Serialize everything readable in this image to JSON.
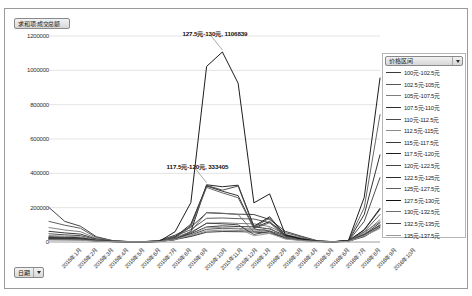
{
  "value_field_button": {
    "label": "求和项:成交总额",
    "caret_icon": "chevron-down-icon"
  },
  "date_field_button": {
    "label": "日期",
    "caret_icon": "chevron-down-icon"
  },
  "legend": {
    "header_label": "价格区间",
    "caret_icon": "chevron-down-icon",
    "position": "right",
    "items": [
      "100元-102.5元",
      "102.5元-105元",
      "105元-107.5元",
      "107.5元-110元",
      "110元-112.5元",
      "112.5元-115元",
      "115元-117.5元",
      "117.5元-120元",
      "120元-122.5元",
      "122.5元-125元",
      "125元-127.5元",
      "127.5元-130元",
      "130元-132.5元",
      "132.5元-135元",
      "135元-137.5元"
    ]
  },
  "annotations": [
    {
      "text": "127.5元-130元, 1106839",
      "series": "127.5元-130元",
      "x_index": 11,
      "value": 1106839
    },
    {
      "text": "117.5元-120元, 333405",
      "series": "117.5元-120元",
      "x_index": 10,
      "value": 333405
    }
  ],
  "chart_data": {
    "type": "line",
    "title": "求和项:成交总额",
    "xlabel": "日期",
    "ylabel": "求和项:成交总额",
    "ylim": [
      0,
      1200000
    ],
    "ytick_labels": [
      "0",
      "200000",
      "400000",
      "600000",
      "800000",
      "1000000",
      "1200000"
    ],
    "yticks": [
      0,
      200000,
      400000,
      600000,
      800000,
      1000000,
      1200000
    ],
    "grid": true,
    "grid_axis": "y",
    "legend_title": "价格区间",
    "legend_position": "right",
    "categories": [
      "2015年1月",
      "2015年2月",
      "2015年3月",
      "2015年4月",
      "2015年5月",
      "2015年6月",
      "2015年7月",
      "2015年8月",
      "2015年9月",
      "2015年10月",
      "2015年11月",
      "2015年12月",
      "2016年1月",
      "2016年2月",
      "2016年3月",
      "2016年4月",
      "2016年5月",
      "2016年6月",
      "2016年7月",
      "2016年8月",
      "2016年9月",
      "2016年10月"
    ],
    "series": [
      {
        "name": "100元-102.5元",
        "color": "#3a3a3a",
        "values": [
          201000,
          120000,
          92000,
          31000,
          9000,
          3000,
          2000,
          9000,
          40000,
          86000,
          170000,
          166000,
          162000,
          160000,
          131000,
          62000,
          34000,
          8000,
          2000,
          9000,
          70000,
          190000
        ]
      },
      {
        "name": "102.5元-105元",
        "color": "#555555",
        "values": [
          120000,
          98000,
          80000,
          26000,
          8000,
          2500,
          1800,
          8000,
          34000,
          72000,
          138000,
          140000,
          136000,
          134000,
          112000,
          54000,
          30000,
          7000,
          1800,
          8000,
          60000,
          160000
        ]
      },
      {
        "name": "105元-107.5元",
        "color": "#7d7d7d",
        "values": [
          84000,
          70000,
          60000,
          21000,
          6500,
          2000,
          1500,
          6500,
          27000,
          58000,
          108000,
          112000,
          108000,
          106000,
          90000,
          44000,
          25000,
          6000,
          1500,
          7000,
          50000,
          130000
        ]
      },
      {
        "name": "107.5元-110元",
        "color": "#2e2e2e",
        "values": [
          62000,
          53000,
          46000,
          17000,
          5500,
          1800,
          1300,
          5500,
          22000,
          48000,
          88000,
          94000,
          90000,
          88000,
          76000,
          38000,
          21000,
          5000,
          1300,
          6000,
          43000,
          112000
        ]
      },
      {
        "name": "110元-112.5元",
        "color": "#4a4a4a",
        "values": [
          48000,
          42000,
          37000,
          14000,
          4800,
          1500,
          1100,
          4800,
          19000,
          41000,
          74000,
          80000,
          77000,
          75000,
          65000,
          33000,
          18000,
          4500,
          1100,
          5500,
          38000,
          100000
        ]
      },
      {
        "name": "112.5元-115元",
        "color": "#8c8c8c",
        "values": [
          38000,
          34000,
          30000,
          12000,
          4200,
          1300,
          1000,
          4200,
          16500,
          36000,
          64000,
          69000,
          67000,
          65000,
          57000,
          29000,
          16000,
          4000,
          1000,
          5000,
          34000,
          92000
        ]
      },
      {
        "name": "115元-117.5元",
        "color": "#383838",
        "values": [
          31000,
          28000,
          25000,
          10000,
          3700,
          1200,
          900,
          3700,
          14500,
          32000,
          57000,
          61000,
          60000,
          58000,
          51000,
          26000,
          14500,
          3600,
          900,
          4600,
          31000,
          86000
        ]
      },
      {
        "name": "117.5元-120元",
        "color": "#1f1f1f",
        "values": [
          26000,
          24000,
          21000,
          8800,
          3300,
          1100,
          800,
          3300,
          13000,
          61000,
          333405,
          322000,
          331000,
          92000,
          147000,
          38000,
          17000,
          3800,
          850,
          5200,
          72000,
          196000
        ]
      },
      {
        "name": "120元-122.5元",
        "color": "#454545",
        "values": [
          24000,
          22000,
          19000,
          8000,
          3000,
          1000,
          750,
          3000,
          25000,
          96000,
          330000,
          302000,
          326000,
          86000,
          140000,
          36000,
          16000,
          3600,
          800,
          6000,
          120000,
          375000
        ]
      },
      {
        "name": "122.5元-125元",
        "color": "#2a2a2a",
        "values": [
          22000,
          20000,
          17500,
          7400,
          2800,
          950,
          700,
          2900,
          30000,
          104000,
          326000,
          296000,
          270000,
          82000,
          120000,
          33000,
          15000,
          3400,
          780,
          7000,
          160000,
          508000
        ]
      },
      {
        "name": "125元-127.5元",
        "color": "#606060",
        "values": [
          20000,
          18500,
          16000,
          6900,
          2600,
          900,
          650,
          2800,
          26000,
          88000,
          318000,
          286000,
          258000,
          78000,
          112000,
          31000,
          14000,
          3200,
          760,
          8000,
          200000,
          742000
        ]
      },
      {
        "name": "127.5元-130元",
        "color": "#111111",
        "values": [
          18000,
          17000,
          15000,
          6400,
          2400,
          850,
          620,
          4000,
          60000,
          230000,
          1023000,
          1106839,
          925000,
          228000,
          280000,
          42000,
          17000,
          3500,
          800,
          9000,
          260000,
          955000
        ]
      },
      {
        "name": "130元-132.5元",
        "color": "#6f6f6f",
        "values": [
          16000,
          15000,
          13500,
          5900,
          2200,
          800,
          580,
          2600,
          20000,
          62000,
          172000,
          168000,
          160000,
          58000,
          82000,
          24000,
          11000,
          2800,
          700,
          5000,
          58000,
          118000
        ]
      },
      {
        "name": "132.5元-135元",
        "color": "#3f3f3f",
        "values": [
          14000,
          13000,
          12000,
          5400,
          2000,
          750,
          540,
          2400,
          17000,
          52000,
          110000,
          106000,
          100000,
          44000,
          62000,
          20000,
          9500,
          2500,
          650,
          4200,
          45000,
          96000
        ]
      },
      {
        "name": "135元-137.5元",
        "color": "#9a9a9a",
        "values": [
          12000,
          11500,
          10500,
          4900,
          1850,
          700,
          500,
          2200,
          14000,
          42000,
          86000,
          84000,
          80000,
          36000,
          50000,
          17000,
          8200,
          2200,
          600,
          3600,
          36000,
          78000
        ]
      }
    ]
  }
}
